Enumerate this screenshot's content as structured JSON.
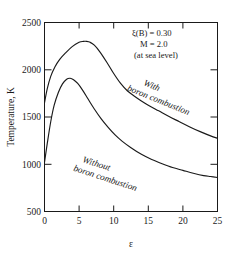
{
  "chart_data": {
    "type": "line",
    "title": "",
    "xlabel": "ε",
    "ylabel": "Temperature, K",
    "xlim": [
      0,
      25
    ],
    "ylim": [
      500,
      2500
    ],
    "xticks": [
      "0",
      "5",
      "10",
      "15",
      "20",
      "25"
    ],
    "xtick_values": [
      0,
      5,
      10,
      15,
      20,
      25
    ],
    "yticks": [
      "500",
      "1000",
      "1500",
      "2000",
      "2500"
    ],
    "ytick_values": [
      500,
      1000,
      1500,
      2000,
      2500
    ],
    "grid": false,
    "legend_position": "inline-curve-labels",
    "series": [
      {
        "name": "With boron combustion",
        "label_line1": "With",
        "label_line2": "boron combustion",
        "x": [
          0.0,
          0.4,
          0.9,
          1.5,
          2.2,
          3.0,
          4.0,
          5.0,
          5.6,
          6.1,
          6.6,
          7.2,
          8.0,
          9.0,
          10.0,
          11.0,
          12.0,
          13.0,
          14.0,
          15.0,
          16.5,
          18.0,
          19.5,
          21.0,
          22.5,
          24.0,
          25.0
        ],
        "y": [
          1650,
          1800,
          1930,
          2030,
          2110,
          2175,
          2245,
          2290,
          2300,
          2300,
          2290,
          2260,
          2190,
          2080,
          1960,
          1855,
          1775,
          1720,
          1670,
          1625,
          1565,
          1505,
          1450,
          1395,
          1345,
          1300,
          1275
        ]
      },
      {
        "name": "Without boron combustion",
        "label_line1": "Without",
        "label_line2": "boron combustion",
        "x": [
          0.0,
          0.4,
          0.9,
          1.4,
          2.0,
          2.6,
          3.2,
          3.7,
          4.2,
          4.8,
          5.5,
          6.3,
          7.2,
          8.2,
          9.2,
          10.2,
          11.2,
          12.5,
          14.0,
          15.5,
          17.0,
          18.5,
          20.0,
          21.5,
          23.0,
          24.0,
          25.0
        ],
        "y": [
          1020,
          1220,
          1450,
          1625,
          1760,
          1850,
          1900,
          1910,
          1895,
          1855,
          1785,
          1690,
          1585,
          1480,
          1390,
          1310,
          1245,
          1175,
          1105,
          1050,
          1005,
          965,
          935,
          905,
          880,
          870,
          860
        ]
      }
    ],
    "annotations": [
      {
        "id": "xi-b",
        "text": "ξ(B) = 0.30"
      },
      {
        "id": "mach",
        "text": "M = 2.0"
      },
      {
        "id": "altitude",
        "text": "(at sea level)"
      }
    ]
  },
  "figure": {
    "background_color": "#ffffff",
    "line_color": "#1a1a1a"
  }
}
